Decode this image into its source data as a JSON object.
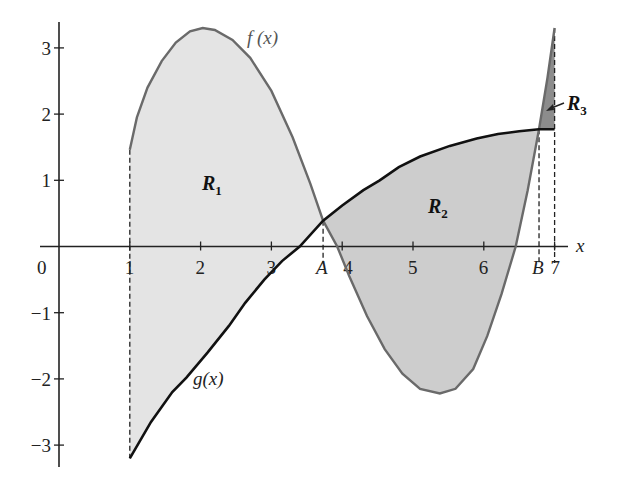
{
  "chart_data": {
    "type": "area",
    "title": "",
    "xlabel": "x",
    "ylabel": "",
    "xlim": [
      0,
      7.2
    ],
    "ylim": [
      -3.3,
      3.35
    ],
    "grid": false,
    "x_ticks": [
      {
        "value": 0,
        "label": "0"
      },
      {
        "value": 1,
        "label": "1"
      },
      {
        "value": 2,
        "label": "2"
      },
      {
        "value": 3,
        "label": "3"
      },
      {
        "value": 3.73,
        "label": "A"
      },
      {
        "value": 4,
        "label": "4"
      },
      {
        "value": 5,
        "label": "5"
      },
      {
        "value": 6,
        "label": "6"
      },
      {
        "value": 6.78,
        "label": "B"
      },
      {
        "value": 7,
        "label": "7"
      }
    ],
    "y_ticks": [
      {
        "value": 3,
        "label": "3"
      },
      {
        "value": 2,
        "label": "2"
      },
      {
        "value": 1,
        "label": "1"
      },
      {
        "value": -1,
        "label": "−1"
      },
      {
        "value": -2,
        "label": "−2"
      },
      {
        "value": -3,
        "label": "−3"
      }
    ],
    "series": [
      {
        "name": "f(x)",
        "color": "#6a6a6a",
        "points": [
          [
            1,
            1.46
          ],
          [
            1.1,
            1.95
          ],
          [
            1.25,
            2.4
          ],
          [
            1.45,
            2.8
          ],
          [
            1.65,
            3.08
          ],
          [
            1.85,
            3.25
          ],
          [
            2.03,
            3.3
          ],
          [
            2.2,
            3.27
          ],
          [
            2.45,
            3.12
          ],
          [
            2.7,
            2.85
          ],
          [
            3.0,
            2.35
          ],
          [
            3.3,
            1.65
          ],
          [
            3.55,
            0.95
          ],
          [
            3.73,
            0.39
          ],
          [
            3.93,
            0.0
          ],
          [
            4.1,
            -0.45
          ],
          [
            4.35,
            -1.05
          ],
          [
            4.6,
            -1.55
          ],
          [
            4.85,
            -1.92
          ],
          [
            5.1,
            -2.15
          ],
          [
            5.38,
            -2.22
          ],
          [
            5.6,
            -2.15
          ],
          [
            5.85,
            -1.85
          ],
          [
            6.05,
            -1.35
          ],
          [
            6.25,
            -0.72
          ],
          [
            6.45,
            0.0
          ],
          [
            6.62,
            0.85
          ],
          [
            6.78,
            1.77
          ],
          [
            6.9,
            2.55
          ],
          [
            7.0,
            3.3
          ]
        ]
      },
      {
        "name": "g(x)",
        "color": "#111111",
        "points": [
          [
            1,
            -3.2
          ],
          [
            1.3,
            -2.65
          ],
          [
            1.6,
            -2.2
          ],
          [
            1.8,
            -1.98
          ],
          [
            2.1,
            -1.6
          ],
          [
            2.4,
            -1.2
          ],
          [
            2.63,
            -0.85
          ],
          [
            2.9,
            -0.5
          ],
          [
            3.15,
            -0.22
          ],
          [
            3.4,
            0.0
          ],
          [
            3.73,
            0.39
          ],
          [
            4.0,
            0.62
          ],
          [
            4.3,
            0.85
          ],
          [
            4.53,
            1.0
          ],
          [
            4.8,
            1.2
          ],
          [
            5.1,
            1.36
          ],
          [
            5.52,
            1.52
          ],
          [
            5.9,
            1.63
          ],
          [
            6.2,
            1.7
          ],
          [
            6.5,
            1.74
          ],
          [
            6.78,
            1.77
          ],
          [
            7.0,
            1.77
          ]
        ]
      }
    ],
    "regions": [
      {
        "name": "R1",
        "label": "R",
        "sub": "1",
        "from": 1,
        "to": 3.73,
        "fill": "#e4e4e4",
        "label_x": 2.1,
        "label_y": 0.95
      },
      {
        "name": "R2",
        "label": "R",
        "sub": "2",
        "from": 3.73,
        "to": 6.78,
        "fill": "#cdcdcd",
        "label_x": 5.2,
        "label_y": 0.6
      },
      {
        "name": "R3",
        "label": "R",
        "sub": "3",
        "from": 6.78,
        "to": 7.0,
        "fill": "#8c8c8c",
        "label_x": 7.08,
        "label_y": 2.2
      }
    ],
    "dashed_verticals": [
      {
        "x": 1,
        "y_top": 1.46,
        "y_bottom": -3.2
      },
      {
        "x": 3.73,
        "y_top": 0.39,
        "y_bottom": -0.25
      },
      {
        "x": 6.78,
        "y_top": 1.77,
        "y_bottom": -0.25
      },
      {
        "x": 7.0,
        "y_top": 3.3,
        "y_bottom": -0.25
      }
    ],
    "annotations": [
      {
        "text": "f (x)",
        "x": 2.65,
        "y": 3.13
      },
      {
        "text": "g(x)",
        "x": 1.88,
        "y": -2.1
      }
    ]
  },
  "labels": {
    "x_axis": "x",
    "f_label": "f (x)",
    "g_label": "g(x)",
    "r1": "R",
    "r1_sub": "1",
    "r2": "R",
    "r2_sub": "2",
    "r3": "R",
    "r3_sub": "3"
  }
}
